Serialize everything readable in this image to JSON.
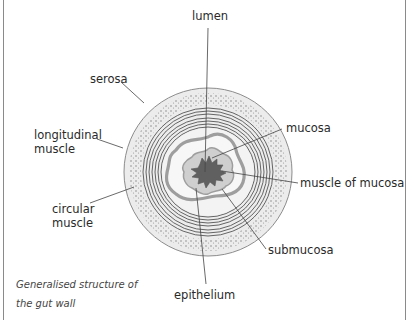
{
  "diagram": {
    "caption_line1": "Generalised structure of",
    "caption_line2": "the gut wall",
    "labels": {
      "lumen": "lumen",
      "serosa": "serosa",
      "longitudinal_muscle_1": "longitudinal",
      "longitudinal_muscle_2": "muscle",
      "mucosa": "mucosa",
      "muscle_of_mucosa": "muscle of mucosa",
      "circular_muscle_1": "circular",
      "circular_muscle_2": "muscle",
      "submucosa": "submucosa",
      "epithelium": "epithelium"
    },
    "colors": {
      "serosa_fill": "#ececec",
      "outline": "#8c8c8c",
      "muscle_lines": "#555555",
      "mucosa_band": "#9e9e9e",
      "lumen_fill": "#606060",
      "leader_lines": "#444444"
    }
  }
}
